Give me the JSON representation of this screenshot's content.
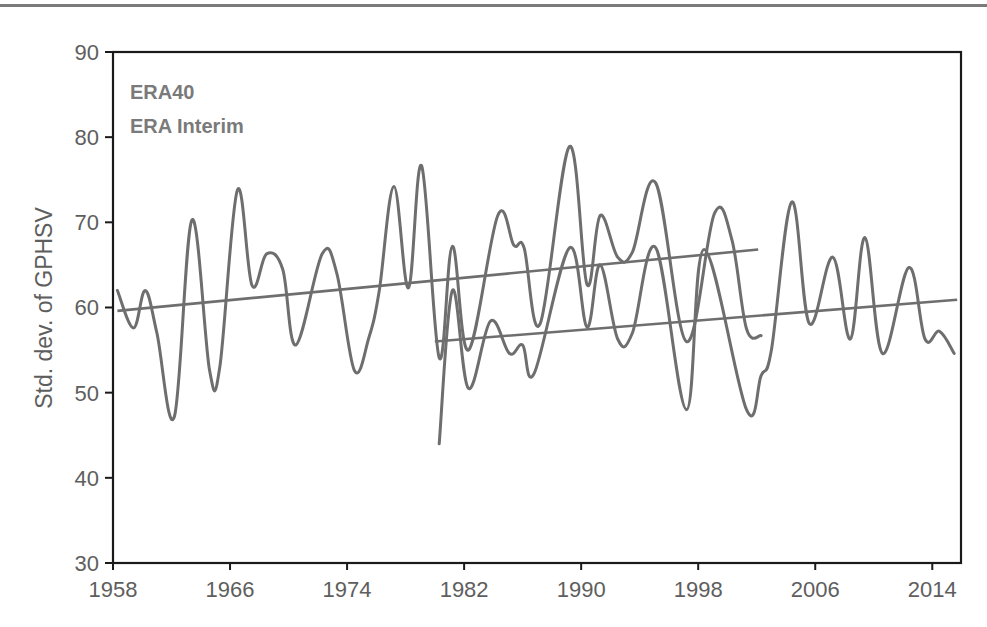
{
  "chart_data": {
    "type": "line",
    "title": "",
    "xlabel": "",
    "ylabel": "Std. dev. of GPHSV",
    "xlim": [
      1958,
      2016
    ],
    "ylim": [
      30,
      90
    ],
    "grid": false,
    "legend_position": "top-left inside",
    "x_ticks": [
      1958,
      1966,
      1974,
      1982,
      1990,
      1998,
      2006,
      2014
    ],
    "x_tick_labels": [
      "1958",
      "1966",
      "1974",
      "1982",
      "1990",
      "1998",
      "2006",
      "2014"
    ],
    "y_ticks": [
      30,
      40,
      50,
      60,
      70,
      80,
      90
    ],
    "y_tick_labels": [
      "30",
      "40",
      "50",
      "60",
      "70",
      "80",
      "90"
    ],
    "legend": [
      "ERA40",
      "ERA Interim"
    ],
    "series": [
      {
        "name": "ERA40",
        "color": "#6e6e6e",
        "points": [
          [
            1958.3,
            62.0
          ],
          [
            1959.4,
            57.6
          ],
          [
            1960.2,
            62.0
          ],
          [
            1961.0,
            57.0
          ],
          [
            1962.2,
            47.2
          ],
          [
            1963.4,
            70.3
          ],
          [
            1964.6,
            52.6
          ],
          [
            1965.3,
            53.0
          ],
          [
            1966.5,
            73.8
          ],
          [
            1967.5,
            62.6
          ],
          [
            1968.5,
            66.3
          ],
          [
            1969.6,
            64.5
          ],
          [
            1970.5,
            55.6
          ],
          [
            1972.3,
            66.3
          ],
          [
            1973.3,
            64.0
          ],
          [
            1974.5,
            52.6
          ],
          [
            1975.5,
            56.5
          ],
          [
            1976.2,
            62.0
          ],
          [
            1977.2,
            74.2
          ],
          [
            1978.2,
            62.3
          ],
          [
            1979.1,
            76.6
          ],
          [
            1980.3,
            54.1
          ],
          [
            1981.2,
            67.2
          ],
          [
            1982.3,
            55.0
          ],
          [
            1984.3,
            70.8
          ],
          [
            1985.4,
            67.3
          ],
          [
            1986.1,
            67.0
          ],
          [
            1987.2,
            58.1
          ],
          [
            1989.2,
            78.9
          ],
          [
            1990.4,
            62.7
          ],
          [
            1991.3,
            70.8
          ],
          [
            1992.5,
            65.9
          ],
          [
            1993.5,
            66.5
          ],
          [
            1995.1,
            74.6
          ],
          [
            1997.2,
            56.0
          ],
          [
            1999.1,
            71.0
          ],
          [
            2000.3,
            68.0
          ],
          [
            2001.3,
            57.5
          ],
          [
            2002.3,
            56.7
          ]
        ],
        "trend": [
          [
            1958.3,
            59.6
          ],
          [
            2002.1,
            66.8
          ]
        ]
      },
      {
        "name": "ERA Interim",
        "color": "#6e6e6e",
        "points": [
          [
            1980.3,
            44.0
          ],
          [
            1981.2,
            62.0
          ],
          [
            1982.3,
            50.5
          ],
          [
            1983.8,
            58.4
          ],
          [
            1985.1,
            54.6
          ],
          [
            1986.0,
            55.6
          ],
          [
            1986.8,
            52.3
          ],
          [
            1989.2,
            67.0
          ],
          [
            1990.4,
            57.7
          ],
          [
            1991.3,
            65.0
          ],
          [
            1992.5,
            56.3
          ],
          [
            1993.5,
            57.0
          ],
          [
            1995.1,
            67.0
          ],
          [
            1997.2,
            48.0
          ],
          [
            1998.4,
            66.8
          ],
          [
            2001.3,
            48.0
          ],
          [
            2002.3,
            52.0
          ],
          [
            2003.0,
            55.0
          ],
          [
            2004.4,
            72.4
          ],
          [
            2005.6,
            58.1
          ],
          [
            2007.2,
            65.9
          ],
          [
            2008.4,
            56.3
          ],
          [
            2009.4,
            68.2
          ],
          [
            2010.6,
            54.6
          ],
          [
            2012.4,
            64.7
          ],
          [
            2013.5,
            56.3
          ],
          [
            2014.5,
            57.2
          ],
          [
            2015.5,
            54.6
          ]
        ],
        "trend": [
          [
            1980.0,
            56.0
          ],
          [
            2015.7,
            60.9
          ]
        ]
      }
    ]
  }
}
